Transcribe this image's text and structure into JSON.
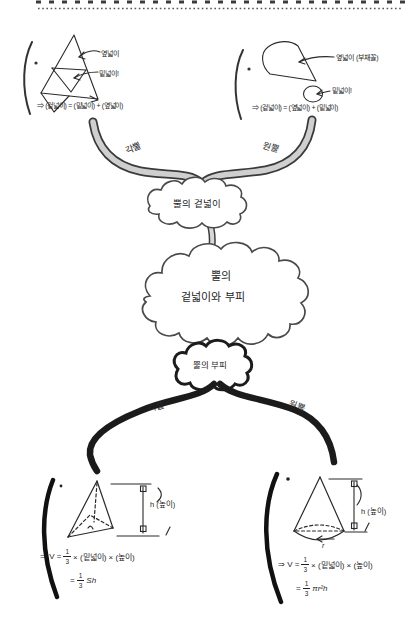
{
  "colors": {
    "ink": "#2a2a2a",
    "ribbon_fill": "#cfcfcf",
    "ribbon_edge": "#3a3a3a",
    "bold_ink": "#1b1b1b"
  },
  "top_left": {
    "lateral_label": "옆넓이",
    "base_label": "밑넓이!",
    "formula": "⇒ (겉넓이) = (밑넓이) + (옆넓이)"
  },
  "top_right": {
    "lateral_label": "옆넓이 (부채꼴)",
    "base_label": "밑넓이!",
    "formula": "⇒ (겉넓이) = (옆넓이) + (밑넓이)"
  },
  "upper_branches": {
    "left": "각뿔",
    "right": "원뿔"
  },
  "clouds": {
    "surface": "뿔의 겉넓이",
    "main_line1": "뿔의",
    "main_line2": "겉넓이와 부피",
    "volume": "뿔의 부피"
  },
  "lower_branches": {
    "left": "각뿔",
    "right": "원뿔"
  },
  "fraction": {
    "num": "1",
    "den": "3"
  },
  "bottom_left": {
    "height_label": "h (높이)",
    "formula1_prefix": "⇒ V =",
    "formula1_suffix": "× (밑넓이) × (높이)",
    "formula2_prefix": "=",
    "formula2_suffix": "Sh"
  },
  "bottom_right": {
    "height_label": "h (높이)",
    "radius_label": "r",
    "formula1_prefix": "⇒ V =",
    "formula1_suffix": "× (밑넓이) × (높이)",
    "formula2_prefix": "=",
    "formula2_suffix": "πr²h"
  }
}
